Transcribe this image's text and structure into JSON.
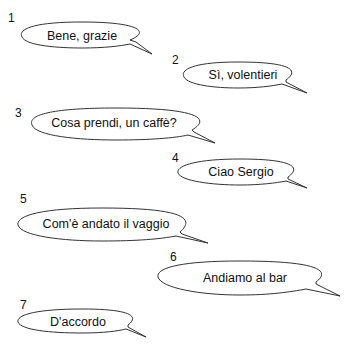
{
  "exercise": {
    "bubbles": [
      {
        "number": "1",
        "text": "Bene, grazie"
      },
      {
        "number": "2",
        "text": "Sì, volentieri"
      },
      {
        "number": "3",
        "text": "Cosa prendi, un caffè?"
      },
      {
        "number": "4",
        "text": "Ciao Sergio"
      },
      {
        "number": "5",
        "text": "Com'è andato il vaggio"
      },
      {
        "number": "6",
        "text": "Andiamo al bar"
      },
      {
        "number": "7",
        "text": "D'accordo"
      }
    ]
  }
}
